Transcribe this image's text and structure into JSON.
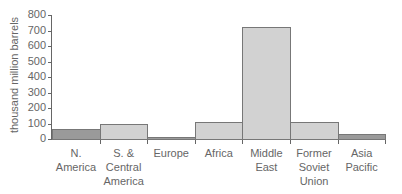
{
  "chart_data": {
    "type": "bar",
    "title": "",
    "xlabel": "",
    "ylabel": "thousand million barrels",
    "ylim": [
      0,
      800
    ],
    "yticks": [
      0,
      100,
      200,
      300,
      400,
      500,
      600,
      700,
      800
    ],
    "categories": [
      "N. America",
      "S. & Central America",
      "Europe",
      "Africa",
      "Middle East",
      "Former Soviet Union",
      "Asia Pacific"
    ],
    "category_lines": [
      [
        "N.",
        "America"
      ],
      [
        "S. &",
        "Central",
        "America"
      ],
      [
        "Europe"
      ],
      [
        "Africa"
      ],
      [
        "Middle",
        "East"
      ],
      [
        "Former",
        "Soviet",
        "Union"
      ],
      [
        "Asia",
        "Pacific"
      ]
    ],
    "values": [
      65,
      100,
      15,
      110,
      725,
      110,
      30
    ],
    "colors": [
      "#9a9a9a",
      "#d2d2d2",
      "#9a9a9a",
      "#d2d2d2",
      "#d2d2d2",
      "#d2d2d2",
      "#9a9a9a"
    ],
    "grid": false,
    "legend": null
  }
}
